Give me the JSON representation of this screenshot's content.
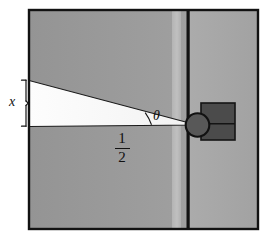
{
  "figure": {
    "canvas": {
      "width": 265,
      "height": 236
    },
    "labels": {
      "x_label": "x",
      "theta_label": "θ",
      "distance_numerator": "1",
      "distance_denominator": "2"
    },
    "colors": {
      "background": "#ffffff",
      "panel_gray_left": "#9a9a9a",
      "panel_gray_right": "#a9a9a9",
      "panel_highlight_strip": "#bdbdbd",
      "wedge_fill": "#fafafa",
      "outline": "#111111",
      "object_dark": "#4d4d4d",
      "circle_fill": "#565656"
    },
    "geometry": {
      "frame": {
        "x": 28,
        "y": 9,
        "width": 231,
        "height": 221
      },
      "divider_line_x": 189,
      "highlight_strip_x": 172,
      "highlight_strip_width": 9,
      "wedge_apex": {
        "x": 197,
        "y": 125
      },
      "wedge_top_left": {
        "y": 80
      },
      "wedge_bottom_left": {
        "y": 126
      },
      "circle": {
        "cx": 198,
        "cy": 125,
        "r": 12
      },
      "object_rect": {
        "x": 201,
        "y": 103,
        "width": 34,
        "height": 37
      },
      "object_rect_divider_y": 124,
      "brace": {
        "x": 23,
        "top": 79,
        "bottom": 127
      },
      "angle_arc_radius": 46
    }
  }
}
